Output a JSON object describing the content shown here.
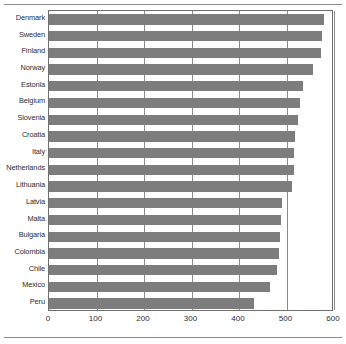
{
  "chart_data": {
    "type": "bar",
    "orientation": "horizontal",
    "title": "",
    "subtitle": "",
    "xlabel": "",
    "ylabel": "",
    "xlim": [
      0,
      600
    ],
    "xticks": [
      0,
      100,
      200,
      300,
      400,
      500,
      600
    ],
    "xticklabels": [
      "0",
      "100",
      "200",
      "300",
      "400",
      "500",
      "600"
    ],
    "grid": true,
    "grid_axis": "x",
    "legend": null,
    "bar_color": "#7d7d7d",
    "plot_border_color": "#6f6f6f",
    "categories": [
      "Denmark",
      "Sweden",
      "Finland",
      "Norway",
      "Estonia",
      "Belgium",
      "Slovenia",
      "Croatia",
      "Italy",
      "Netherlands",
      "Lithuania",
      "Latvia",
      "Malta",
      "Bulgaria",
      "Colombia",
      "Chile",
      "Mexico",
      "Peru"
    ],
    "values": [
      578,
      574,
      572,
      556,
      535,
      528,
      525,
      518,
      516,
      515,
      512,
      491,
      489,
      486,
      484,
      481,
      466,
      432
    ]
  }
}
